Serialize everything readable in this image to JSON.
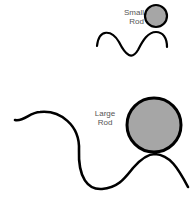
{
  "diagram": {
    "small": {
      "label_line1": "Small",
      "label_line2": "Rod"
    },
    "large": {
      "label_line1": "Large",
      "label_line2": "Rod"
    },
    "colors": {
      "rod_fill": "#a6a6a6",
      "stroke": "#000000",
      "label": "#555555"
    }
  }
}
